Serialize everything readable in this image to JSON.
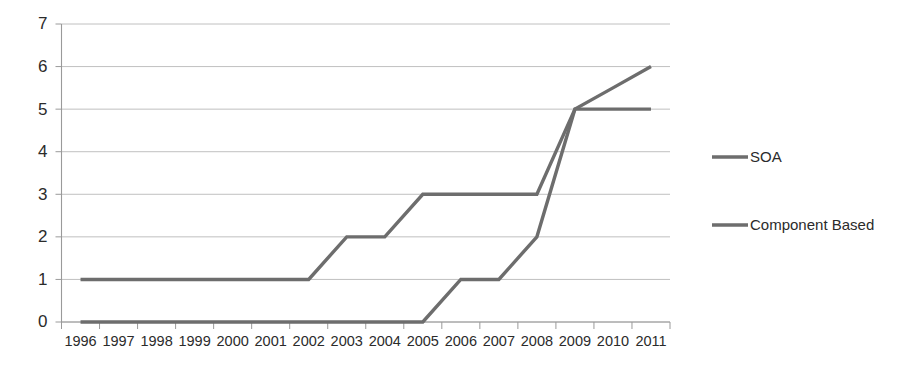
{
  "chart_data": {
    "type": "line",
    "title": "",
    "subtitle": "",
    "xlabel": "",
    "ylabel": "",
    "categories": [
      "1996",
      "1997",
      "1998",
      "1999",
      "2000",
      "2001",
      "2002",
      "2003",
      "2004",
      "2005",
      "2006",
      "2007",
      "2008",
      "2009",
      "2010",
      "2011"
    ],
    "ylim": [
      0,
      7
    ],
    "ytick_labels": [
      "0",
      "1",
      "2",
      "3",
      "4",
      "5",
      "6",
      "7"
    ],
    "ytick_values": [
      0,
      1,
      2,
      3,
      4,
      5,
      6,
      7
    ],
    "grid": true,
    "legend_position": "right",
    "series": [
      {
        "name": "SOA",
        "color": "#6d6d6d",
        "values": [
          1,
          1,
          1,
          1,
          1,
          1,
          1,
          2,
          2,
          3,
          3,
          3,
          3,
          5,
          5,
          5
        ]
      },
      {
        "name": "Component Based",
        "color": "#6d6d6d",
        "values": [
          0,
          0,
          0,
          0,
          0,
          0,
          0,
          0,
          0,
          0,
          1,
          1,
          2,
          5,
          5.5,
          6
        ]
      }
    ]
  },
  "legend": {
    "items": [
      {
        "label": "SOA"
      },
      {
        "label": "Component Based"
      }
    ]
  },
  "colors": {
    "series_gray": "#6d6d6d",
    "gridline": "#b9b9b9",
    "axis": "#9a9a9a",
    "text": "#2b2b2b",
    "background": "#ffffff"
  }
}
